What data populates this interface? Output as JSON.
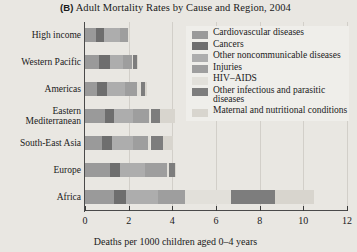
{
  "chart_data": {
    "type": "bar",
    "orientation": "horizontal",
    "stacked": true,
    "panel_letter": "(B)",
    "title": "Adult Mortality Rates by Cause and Region, 2004",
    "xlabel": "Deaths per 1000 children aged 0–4 years",
    "ylabel": "",
    "xlim": [
      0,
      12
    ],
    "xticks": [
      0,
      2,
      4,
      6,
      8,
      10,
      12
    ],
    "xtick_labels": [
      "0",
      "2",
      "4",
      "6",
      "8",
      "10",
      "12"
    ],
    "grid": true,
    "legend_position": "upper right",
    "categories": [
      "High income",
      "Western Pacific",
      "Americas",
      "Eastern Mediterranean",
      "South-East Asia",
      "Europe",
      "Africa"
    ],
    "series": [
      {
        "name": "Cardiovascular diseases",
        "color": "#9a9a9a",
        "values": [
          0.5,
          0.62,
          0.55,
          0.9,
          0.8,
          1.15,
          1.35
        ]
      },
      {
        "name": "Cancers",
        "color": "#6e6e6e",
        "values": [
          0.38,
          0.52,
          0.48,
          0.45,
          0.45,
          0.45,
          0.55
        ]
      },
      {
        "name": "Other noncommunicable diseases",
        "color": "#adadad",
        "values": [
          0.72,
          0.62,
          0.8,
          0.85,
          0.95,
          1.15,
          1.45
        ]
      },
      {
        "name": "Injuries",
        "color": "#9e9e9e",
        "values": [
          0.38,
          0.38,
          0.55,
          0.75,
          0.7,
          1.0,
          1.25
        ]
      },
      {
        "name": "HIV–AIDS",
        "color": "#e2e0da",
        "values": [
          0.02,
          0.04,
          0.18,
          0.05,
          0.1,
          0.1,
          2.1
        ]
      },
      {
        "name": "Other infectious and parasitic diseases",
        "color": "#7d7d7d",
        "values": [
          0.03,
          0.2,
          0.18,
          0.45,
          0.55,
          0.28,
          2.0
        ]
      },
      {
        "name": "Maternal and nutritional conditions",
        "color": "#d8d5ce",
        "values": [
          0.02,
          0.05,
          0.08,
          0.65,
          0.5,
          0.05,
          1.8
        ]
      }
    ],
    "totals": [
      2.05,
      2.43,
      2.82,
      4.1,
      4.05,
      4.18,
      10.5
    ]
  }
}
